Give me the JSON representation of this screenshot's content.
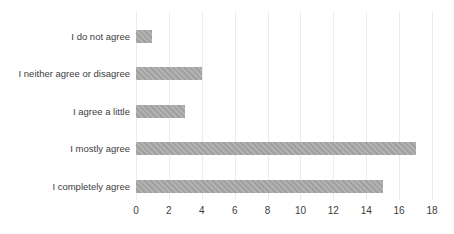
{
  "chart_data": {
    "type": "bar",
    "orientation": "horizontal",
    "title": "",
    "xlabel": "",
    "ylabel": "",
    "categories": [
      "I do not agree",
      "I neither agree or disagree",
      "I agree a little",
      "I mostly agree",
      "I completely agree"
    ],
    "values": [
      1,
      4,
      3,
      17,
      15
    ],
    "xlim": [
      0,
      18
    ],
    "xticks": [
      0,
      2,
      4,
      6,
      8,
      10,
      12,
      14,
      16,
      18
    ],
    "grid": "vertical-only",
    "legend": "none",
    "colors": {
      "bar": "#a9a9a9",
      "gridline": "#ececec",
      "text": "#3d3d3d",
      "background": "#ffffff"
    }
  }
}
